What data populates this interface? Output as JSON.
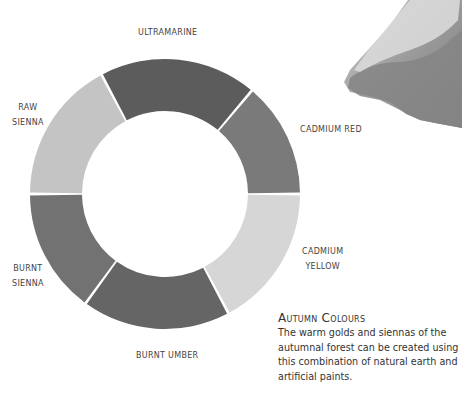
{
  "wheel": {
    "center": [
      165,
      194
    ],
    "outer_radius": 135,
    "inner_radius": 83,
    "segments": [
      {
        "name": "ULTRAMARINE",
        "start": -118,
        "end": -50,
        "shade": "#5c5c5c"
      },
      {
        "name": "CADMIUM RED",
        "start": -50,
        "end": 0,
        "shade": "#7a7a7a"
      },
      {
        "name": "CADMIUM YELLOW",
        "start": 0,
        "end": 62,
        "shade": "#d6d6d6"
      },
      {
        "name": "BURNT UMBER",
        "start": 62,
        "end": 126,
        "shade": "#656565"
      },
      {
        "name": "BURNT SIENNA",
        "start": 126,
        "end": 180,
        "shade": "#727272"
      },
      {
        "name": "RAW SIENNA",
        "start": 180,
        "end": 242,
        "shade": "#c4c4c4"
      }
    ]
  },
  "labels": {
    "ultramarine": "ULTRAMARINE",
    "raw_line1": "RAW",
    "raw_line2": "SIENNA",
    "cadmium_red": "CADMIUM RED",
    "cadmium_yellow_line1": "CADMIUM",
    "cadmium_yellow_line2": "YELLOW",
    "burnt_sienna_line1": "BURNT",
    "burnt_sienna_line2": "SIENNA",
    "burnt_umber": "BURNT UMBER"
  },
  "caption": {
    "title": "Autumn Colours",
    "body": "The warm golds and siennas of the autumnal forest can be created using this combination of natural earth and artificial paints."
  }
}
